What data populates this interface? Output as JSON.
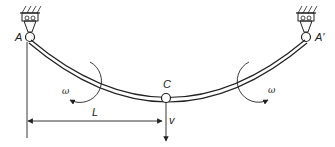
{
  "diagram": {
    "type": "curved-beam-mechanics",
    "labels": {
      "left_support": "A",
      "right_support": "A'",
      "midpoint": "C",
      "left_rotation": "ω",
      "right_rotation": "ω",
      "span": "L",
      "deflection": "v"
    },
    "colors": {
      "stroke": "#222222",
      "background": "#ffffff"
    }
  }
}
